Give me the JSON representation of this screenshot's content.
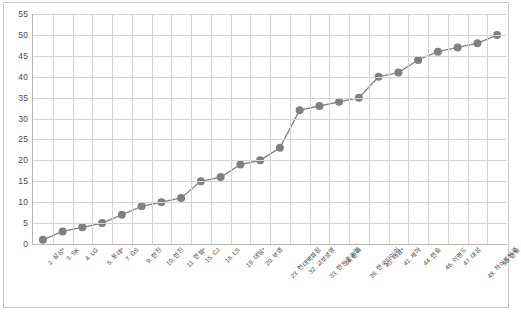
{
  "chart_data": {
    "type": "line",
    "title": "",
    "subtitle": "",
    "xlabel": "",
    "ylabel": "",
    "ylim": [
      0,
      55
    ],
    "y_ticks": [
      0,
      5,
      10,
      15,
      20,
      25,
      30,
      35,
      40,
      45,
      50,
      55
    ],
    "grid": true,
    "legend": "none",
    "marker": "circle",
    "series_color": "#808080",
    "line_color": "#808080",
    "categories": [
      "1. 삼성*",
      "3. SK",
      "4. LG",
      "5. 롯데*",
      "7. GS",
      "9. 한진",
      "10. 한진",
      "11. 한화*",
      "15. CJ",
      "16. LS",
      "19. 대림*",
      "20. 부영",
      "23. 현대백화점",
      "32. 교보생명",
      "33. 한진중공업",
      "34. 한라",
      "36. 한국타이어",
      "40. 태광*",
      "41. 세아",
      "44. 한솔",
      "46. 이랜드",
      "47. 대성",
      "48. 하이트진로",
      "50. 한솔"
    ],
    "values": [
      1,
      3,
      4,
      5,
      7,
      9,
      10,
      11,
      15,
      16,
      19,
      20,
      23,
      32,
      33,
      34,
      35,
      40,
      41,
      44,
      46,
      47,
      48,
      50
    ],
    "series": [
      {
        "name": "순위",
        "values": [
          1,
          3,
          4,
          5,
          7,
          9,
          10,
          11,
          15,
          16,
          19,
          20,
          23,
          32,
          33,
          34,
          35,
          40,
          41,
          44,
          46,
          47,
          48,
          50
        ]
      }
    ]
  },
  "colors": {
    "series": "#808080",
    "grid": "#d4d4d4",
    "axis": "#b6b6b6",
    "frame": "#c8c8c8",
    "text": "#4a4a4a"
  }
}
